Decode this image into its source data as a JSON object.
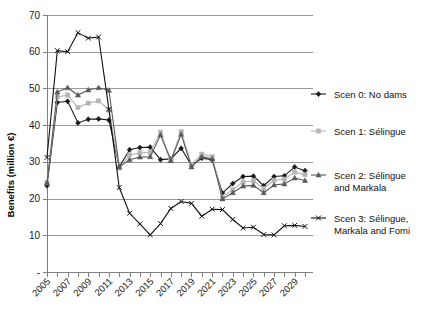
{
  "chart_data": {
    "type": "line",
    "title": "",
    "xlabel": "",
    "ylabel": "Benefits (million €)",
    "ylim": [
      0,
      70
    ],
    "ytick_labels": [
      "-",
      "10",
      "20",
      "30",
      "40",
      "50",
      "60",
      "70"
    ],
    "ytick_values": [
      0,
      10,
      20,
      30,
      40,
      50,
      60,
      70
    ],
    "grid": true,
    "legend_position": "right",
    "x": [
      2005,
      2006,
      2007,
      2008,
      2009,
      2010,
      2011,
      2012,
      2013,
      2014,
      2015,
      2016,
      2017,
      2018,
      2019,
      2020,
      2021,
      2022,
      2023,
      2024,
      2025,
      2026,
      2027,
      2028,
      2029,
      2030
    ],
    "xtick_labels": [
      "2005",
      "2007",
      "2009",
      "2011",
      "2013",
      "2015",
      "2017",
      "2019",
      "2021",
      "2023",
      "2025",
      "2027",
      "2029"
    ],
    "xlim": [
      2005,
      2030
    ],
    "series": [
      {
        "name": "Scen 0: No dams",
        "color": "#1a1a1a",
        "marker": "diamond",
        "values": [
          23.5,
          46.2,
          46.5,
          40.6,
          41.6,
          41.7,
          41.4,
          28.6,
          33.3,
          33.9,
          34.0,
          30.6,
          30.8,
          33.7,
          29.0,
          31.0,
          30.6,
          21.5,
          24.1,
          26.0,
          26.1,
          23.5,
          26.0,
          26.2,
          28.6,
          27.6
        ]
      },
      {
        "name": "Scen 1: Sélingue",
        "color": "#b4b4b4",
        "marker": "square",
        "values": [
          24.3,
          47.7,
          48.2,
          44.8,
          46.0,
          46.6,
          44.1,
          28.3,
          31.9,
          32.5,
          32.6,
          38.1,
          30.5,
          38.2,
          29.3,
          32.1,
          31.4,
          20.4,
          22.5,
          24.5,
          24.8,
          22.8,
          25.0,
          25.3,
          27.2,
          26.5
        ]
      },
      {
        "name": "Scen 2: Sélingue and Markala",
        "color": "#5a5a5a",
        "marker": "triangle",
        "values": [
          24.3,
          49.0,
          50.2,
          48.2,
          49.6,
          50.2,
          49.5,
          28.6,
          30.6,
          31.3,
          31.4,
          37.3,
          30.3,
          37.5,
          28.6,
          31.4,
          30.8,
          19.9,
          21.6,
          23.4,
          23.6,
          21.6,
          23.7,
          24.0,
          25.6,
          24.9
        ]
      },
      {
        "name": "Scen 3: Sélingue, Markala and Fomi",
        "color": "#111111",
        "marker": "cross",
        "values": [
          31.2,
          60.3,
          60.0,
          65.2,
          63.7,
          64.0,
          44.3,
          23.0,
          16.0,
          13.1,
          10.1,
          13.2,
          17.3,
          19.2,
          18.7,
          15.2,
          17.1,
          17.0,
          14.3,
          12.0,
          12.2,
          10.2,
          10.1,
          12.6,
          12.7,
          12.4
        ]
      }
    ],
    "legend_entries": [
      {
        "label_line1": "Scen 0: No dams",
        "label_line2": "",
        "marker": "diamond",
        "color": "#1a1a1a"
      },
      {
        "label_line1": "Scen 1: Sélingue",
        "label_line2": "",
        "marker": "square",
        "color": "#b4b4b4"
      },
      {
        "label_line1": "Scen 2: Sélingue",
        "label_line2": "and Markala",
        "marker": "triangle",
        "color": "#5a5a5a"
      },
      {
        "label_line1": "Scen 3: Sélingue,",
        "label_line2": "Markala and Fomi",
        "marker": "cross",
        "color": "#111111"
      }
    ]
  }
}
